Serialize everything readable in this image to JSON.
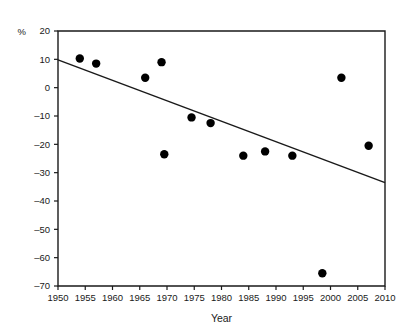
{
  "chart_data": {
    "type": "scatter",
    "title": "",
    "xlabel": "Year",
    "ylabel": "",
    "yunit": "%",
    "xlim": [
      1950,
      2010
    ],
    "ylim": [
      -70,
      20
    ],
    "grid": false,
    "legend": "none",
    "xticks": [
      1950,
      1955,
      1960,
      1965,
      1970,
      1975,
      1980,
      1985,
      1990,
      1995,
      2000,
      2005,
      2010
    ],
    "xticklabels": [
      "1950",
      "1955",
      "1960",
      "1965",
      "1970",
      "1975",
      "1980",
      "1985",
      "1990",
      "1995",
      "2000",
      "2005",
      "2010"
    ],
    "yticks": [
      20,
      10,
      0,
      -10,
      -20,
      -30,
      -40,
      -50,
      -60,
      -70
    ],
    "yticklabels": [
      "20",
      "10",
      "0",
      "-10",
      "-20",
      "-30",
      "-40",
      "-50",
      "-60",
      "-70"
    ],
    "x": [
      1954,
      1957,
      1966,
      1969,
      1969.5,
      1974.5,
      1978,
      1984,
      1988,
      1993,
      1998.5,
      2002,
      2007
    ],
    "y": [
      10.3,
      8.5,
      3.5,
      9.0,
      -23.5,
      -10.5,
      -12.5,
      -24.0,
      -22.5,
      -24.0,
      -65.5,
      3.5,
      -20.5
    ],
    "series": [
      {
        "name": "observations",
        "marker": "filled-circle",
        "color": "#000000",
        "points": [
          {
            "x": 1954,
            "y": 10.3
          },
          {
            "x": 1957,
            "y": 8.5
          },
          {
            "x": 1966,
            "y": 3.5
          },
          {
            "x": 1969,
            "y": 9.0
          },
          {
            "x": 1969.5,
            "y": -23.5
          },
          {
            "x": 1974.5,
            "y": -10.5
          },
          {
            "x": 1978,
            "y": -12.5
          },
          {
            "x": 1984,
            "y": -24.0
          },
          {
            "x": 1988,
            "y": -22.5
          },
          {
            "x": 1993,
            "y": -24.0
          },
          {
            "x": 1998.5,
            "y": -65.5
          },
          {
            "x": 2002,
            "y": 3.5
          },
          {
            "x": 2007,
            "y": -20.5
          }
        ]
      }
    ],
    "trendline": {
      "name": "linear-fit",
      "x_start": 1950,
      "y_start": 9.8,
      "x_end": 2010,
      "y_end": -33.5,
      "color": "#1a1a1a"
    }
  },
  "axes": {
    "x_title": "Year",
    "y_unit": "%"
  }
}
